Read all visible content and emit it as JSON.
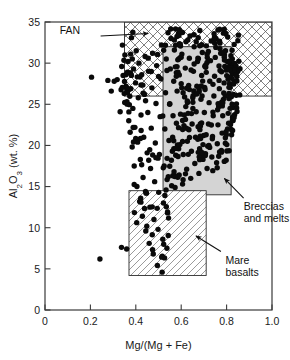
{
  "chart_data": {
    "type": "scatter",
    "title": "",
    "subtitle": "",
    "xlabel": "Mg/(Mg + Fe)",
    "ylabel": "Al2O3 (wt. %)",
    "ylabel_display": "Al₂O₃ (wt. %)",
    "xlim": [
      0,
      1.0
    ],
    "ylim": [
      0,
      35
    ],
    "xticks": [
      0,
      0.2,
      0.4,
      0.6,
      0.8,
      1.0
    ],
    "xtick_labels": [
      "0",
      "0.2",
      "0.4",
      "0.6",
      "0.8",
      "1.0"
    ],
    "yticks": [
      0,
      5,
      10,
      15,
      20,
      25,
      30,
      35
    ],
    "ytick_labels": [
      "0",
      "5",
      "10",
      "15",
      "20",
      "25",
      "30",
      "35"
    ],
    "grid": false,
    "legend": "none",
    "marker": {
      "shape": "circle",
      "color": "#0a0a0a",
      "size_px": 5.4
    },
    "regions": [
      {
        "name": "FAN",
        "label": "FAN",
        "fill": "crosshatch",
        "color": "#2b2b2b",
        "x_range": [
          0.35,
          1.0
        ],
        "y_range": [
          26.0,
          35.0
        ],
        "label_x": 0.155,
        "label_y": 33.6,
        "arrow_from": [
          0.245,
          33.3
        ],
        "arrow_to": [
          0.455,
          33.6
        ]
      },
      {
        "name": "Breccias and melts",
        "label": "Breccias\nand melts",
        "label_line1": "Breccias",
        "label_line2": "and melts",
        "fill": "solid-gray",
        "color": "#d4d4d4",
        "x_range": [
          0.52,
          0.82
        ],
        "y_range": [
          14.0,
          32.0
        ],
        "label_x": 0.875,
        "label_y": 12.1,
        "arrow_from": [
          0.875,
          13.6
        ],
        "arrow_to": [
          0.79,
          16.0
        ]
      },
      {
        "name": "Mare basalts",
        "label": "Mare\nbasalts",
        "label_line1": "Mare",
        "label_line2": "basalts",
        "fill": "diagonal-hatch",
        "color": "#2b2b2b",
        "x_range": [
          0.37,
          0.71
        ],
        "y_range": [
          4.2,
          14.5
        ],
        "label_x": 0.795,
        "label_y": 5.6,
        "arrow_from": [
          0.775,
          7.1
        ],
        "arrow_to": [
          0.665,
          9.0
        ]
      }
    ],
    "series": [
      {
        "name": "Lunar samples",
        "n_points": 452,
        "description": "Dense vertical cluster at Mg# 0.55-0.80 spanning Al2O3 15-33 wt%, plus a sparser diagonal trend rising from (0.37, 2) to (0.55, 15).",
        "points": [
          [
            0.205,
            28.3
          ],
          [
            0.242,
            6.2
          ],
          [
            0.277,
            27.9
          ],
          [
            0.292,
            26.6
          ],
          [
            0.305,
            27.8
          ],
          [
            0.318,
            28.0
          ],
          [
            0.331,
            24.1
          ],
          [
            0.338,
            29.6
          ],
          [
            0.344,
            28.5
          ],
          [
            0.349,
            26.3
          ],
          [
            0.352,
            31.0
          ],
          [
            0.357,
            27.2
          ],
          [
            0.361,
            25.3
          ],
          [
            0.366,
            30.2
          ],
          [
            0.369,
            23.0
          ],
          [
            0.372,
            28.8
          ],
          [
            0.375,
            21.6
          ],
          [
            0.378,
            26.9
          ],
          [
            0.381,
            33.1
          ],
          [
            0.384,
            19.8
          ],
          [
            0.387,
            24.5
          ],
          [
            0.39,
            29.3
          ],
          [
            0.393,
            17.5
          ],
          [
            0.396,
            22.2
          ],
          [
            0.399,
            27.6
          ],
          [
            0.402,
            31.5
          ],
          [
            0.405,
            15.0
          ],
          [
            0.408,
            20.4
          ],
          [
            0.411,
            25.8
          ],
          [
            0.414,
            30.0
          ],
          [
            0.417,
            13.2
          ],
          [
            0.42,
            18.3
          ],
          [
            0.423,
            23.7
          ],
          [
            0.426,
            28.6
          ],
          [
            0.429,
            11.4
          ],
          [
            0.432,
            16.1
          ],
          [
            0.435,
            21.0
          ],
          [
            0.438,
            26.2
          ],
          [
            0.441,
            30.8
          ],
          [
            0.444,
            9.6
          ],
          [
            0.447,
            14.2
          ],
          [
            0.45,
            19.1
          ],
          [
            0.453,
            24.0
          ],
          [
            0.456,
            29.0
          ],
          [
            0.459,
            8.1
          ],
          [
            0.462,
            12.5
          ],
          [
            0.465,
            17.2
          ],
          [
            0.468,
            22.1
          ],
          [
            0.471,
            27.0
          ],
          [
            0.474,
            31.2
          ],
          [
            0.477,
            6.8
          ],
          [
            0.48,
            11.0
          ],
          [
            0.483,
            15.6
          ],
          [
            0.486,
            20.3
          ],
          [
            0.489,
            25.1
          ],
          [
            0.492,
            29.7
          ],
          [
            0.495,
            5.4
          ],
          [
            0.498,
            9.8
          ],
          [
            0.501,
            14.3
          ],
          [
            0.504,
            18.9
          ],
          [
            0.507,
            23.5
          ],
          [
            0.51,
            28.1
          ],
          [
            0.513,
            32.2
          ],
          [
            0.516,
            4.6
          ],
          [
            0.519,
            8.6
          ],
          [
            0.522,
            13.0
          ],
          [
            0.525,
            17.5
          ],
          [
            0.528,
            22.0
          ],
          [
            0.531,
            26.4
          ],
          [
            0.534,
            30.5
          ],
          [
            0.537,
            7.5
          ],
          [
            0.54,
            11.8
          ],
          [
            0.543,
            16.2
          ],
          [
            0.546,
            20.6
          ],
          [
            0.549,
            25.0
          ],
          [
            0.552,
            29.3
          ],
          [
            0.555,
            33.0
          ],
          [
            0.558,
            15.1
          ],
          [
            0.561,
            19.3
          ],
          [
            0.564,
            23.6
          ],
          [
            0.567,
            27.8
          ],
          [
            0.57,
            31.6
          ],
          [
            0.573,
            14.9
          ],
          [
            0.576,
            18.8
          ],
          [
            0.579,
            22.7
          ],
          [
            0.582,
            26.6
          ],
          [
            0.585,
            30.4
          ],
          [
            0.588,
            33.6
          ],
          [
            0.591,
            16.4
          ],
          [
            0.594,
            20.1
          ],
          [
            0.597,
            23.8
          ],
          [
            0.6,
            27.5
          ],
          [
            0.603,
            31.1
          ],
          [
            0.606,
            15.3
          ],
          [
            0.609,
            18.9
          ],
          [
            0.612,
            22.4
          ],
          [
            0.615,
            25.9
          ],
          [
            0.618,
            29.4
          ],
          [
            0.621,
            32.6
          ],
          [
            0.624,
            17.1
          ],
          [
            0.627,
            20.5
          ],
          [
            0.63,
            23.9
          ],
          [
            0.633,
            27.3
          ],
          [
            0.636,
            30.6
          ],
          [
            0.639,
            33.3
          ],
          [
            0.642,
            16.0
          ],
          [
            0.645,
            19.3
          ],
          [
            0.648,
            22.6
          ],
          [
            0.651,
            25.8
          ],
          [
            0.654,
            29.0
          ],
          [
            0.657,
            32.0
          ],
          [
            0.66,
            17.8
          ],
          [
            0.663,
            21.0
          ],
          [
            0.666,
            24.1
          ],
          [
            0.669,
            27.2
          ],
          [
            0.672,
            30.2
          ],
          [
            0.675,
            33.1
          ],
          [
            0.678,
            16.6
          ],
          [
            0.681,
            19.6
          ],
          [
            0.684,
            22.6
          ],
          [
            0.687,
            25.6
          ],
          [
            0.69,
            28.5
          ],
          [
            0.693,
            31.3
          ],
          [
            0.696,
            18.3
          ],
          [
            0.699,
            21.2
          ],
          [
            0.702,
            24.0
          ],
          [
            0.705,
            26.8
          ],
          [
            0.708,
            29.5
          ],
          [
            0.711,
            32.1
          ],
          [
            0.714,
            17.2
          ],
          [
            0.717,
            19.9
          ],
          [
            0.72,
            22.6
          ],
          [
            0.723,
            25.2
          ],
          [
            0.726,
            27.8
          ],
          [
            0.729,
            30.3
          ],
          [
            0.732,
            32.7
          ],
          [
            0.735,
            18.6
          ],
          [
            0.738,
            21.1
          ],
          [
            0.741,
            23.6
          ],
          [
            0.744,
            26.0
          ],
          [
            0.747,
            28.4
          ],
          [
            0.75,
            30.7
          ],
          [
            0.753,
            33.0
          ],
          [
            0.756,
            17.9
          ],
          [
            0.759,
            20.2
          ],
          [
            0.762,
            22.5
          ],
          [
            0.765,
            24.7
          ],
          [
            0.768,
            26.9
          ],
          [
            0.771,
            29.1
          ],
          [
            0.774,
            31.2
          ],
          [
            0.777,
            19.4
          ],
          [
            0.78,
            21.5
          ],
          [
            0.783,
            23.6
          ],
          [
            0.786,
            25.6
          ],
          [
            0.789,
            27.6
          ],
          [
            0.792,
            29.6
          ],
          [
            0.795,
            31.5
          ],
          [
            0.798,
            18.2
          ],
          [
            0.801,
            20.1
          ],
          [
            0.804,
            22.0
          ],
          [
            0.807,
            23.9
          ],
          [
            0.81,
            25.7
          ],
          [
            0.813,
            27.5
          ],
          [
            0.816,
            29.2
          ],
          [
            0.819,
            30.9
          ],
          [
            0.822,
            21.3
          ],
          [
            0.825,
            23.0
          ],
          [
            0.828,
            24.6
          ],
          [
            0.831,
            26.2
          ],
          [
            0.834,
            27.8
          ],
          [
            0.837,
            29.3
          ],
          [
            0.843,
            29.2
          ],
          [
            0.852,
            33.4
          ]
        ]
      }
    ]
  }
}
